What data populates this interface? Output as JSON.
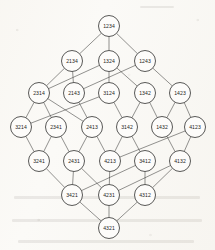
{
  "diagram": {
    "type": "hasse-diagram",
    "node_colors": {
      "fill": "#fdfcfa",
      "stroke": "#2f2f2d",
      "label": "#1f1f1e"
    },
    "edge_color": "#3a3a38",
    "background": "#fbfaf7",
    "node_radius": 10.5,
    "ranks": [
      {
        "rank": 0,
        "y": 26,
        "nodes": [
          {
            "id": "1234",
            "label": "1234",
            "x": 109
          }
        ]
      },
      {
        "rank": 1,
        "y": 61,
        "nodes": [
          {
            "id": "2134",
            "label": "2134",
            "x": 72
          },
          {
            "id": "1324",
            "label": "1324",
            "x": 109
          },
          {
            "id": "1243",
            "label": "1243",
            "x": 145
          }
        ]
      },
      {
        "rank": 2,
        "y": 93,
        "nodes": [
          {
            "id": "2314",
            "label": "2314",
            "x": 39
          },
          {
            "id": "2143",
            "label": "2143",
            "x": 74
          },
          {
            "id": "3124",
            "label": "3124",
            "x": 109
          },
          {
            "id": "1342",
            "label": "1342",
            "x": 145
          },
          {
            "id": "1423",
            "label": "1423",
            "x": 180
          }
        ]
      },
      {
        "rank": 3,
        "y": 127,
        "nodes": [
          {
            "id": "3214",
            "label": "3214",
            "x": 21
          },
          {
            "id": "2341",
            "label": "2341",
            "x": 56
          },
          {
            "id": "2413",
            "label": "2413",
            "x": 92
          },
          {
            "id": "3142",
            "label": "3142",
            "x": 127
          },
          {
            "id": "1432",
            "label": "1432",
            "x": 162
          },
          {
            "id": "4123",
            "label": "4123",
            "x": 195
          }
        ]
      },
      {
        "rank": 4,
        "y": 161,
        "nodes": [
          {
            "id": "3241",
            "label": "3241",
            "x": 39
          },
          {
            "id": "2431",
            "label": "2431",
            "x": 74
          },
          {
            "id": "4213",
            "label": "4213",
            "x": 110
          },
          {
            "id": "3412",
            "label": "3412",
            "x": 145
          },
          {
            "id": "4132",
            "label": "4132",
            "x": 180
          }
        ]
      },
      {
        "rank": 5,
        "y": 195,
        "nodes": [
          {
            "id": "3421",
            "label": "3421",
            "x": 72
          },
          {
            "id": "4231",
            "label": "4231",
            "x": 109
          },
          {
            "id": "4312",
            "label": "4312",
            "x": 145
          }
        ]
      },
      {
        "rank": 6,
        "y": 228,
        "nodes": [
          {
            "id": "4321",
            "label": "4321",
            "x": 109
          }
        ]
      }
    ],
    "edges": [
      [
        "1234",
        "2134"
      ],
      [
        "1234",
        "1324"
      ],
      [
        "1234",
        "1243"
      ],
      [
        "2134",
        "2314"
      ],
      [
        "2134",
        "2143"
      ],
      [
        "1324",
        "2314"
      ],
      [
        "1324",
        "3124"
      ],
      [
        "1324",
        "1342"
      ],
      [
        "1243",
        "2143"
      ],
      [
        "1243",
        "1423"
      ],
      [
        "2314",
        "3214"
      ],
      [
        "2314",
        "2341"
      ],
      [
        "2314",
        "2413"
      ],
      [
        "2143",
        "2413"
      ],
      [
        "3124",
        "3214"
      ],
      [
        "3124",
        "3142"
      ],
      [
        "1342",
        "3142"
      ],
      [
        "1342",
        "1432"
      ],
      [
        "1423",
        "1432"
      ],
      [
        "1423",
        "4123"
      ],
      [
        "3214",
        "3241"
      ],
      [
        "2341",
        "3241"
      ],
      [
        "2341",
        "2431"
      ],
      [
        "2413",
        "2431"
      ],
      [
        "2413",
        "4213"
      ],
      [
        "3142",
        "3412"
      ],
      [
        "3142",
        "4213"
      ],
      [
        "1432",
        "4132"
      ],
      [
        "4123",
        "4213"
      ],
      [
        "4123",
        "4132"
      ],
      [
        "3241",
        "3421"
      ],
      [
        "2431",
        "3421"
      ],
      [
        "2431",
        "4231"
      ],
      [
        "4213",
        "4231"
      ],
      [
        "3412",
        "3421"
      ],
      [
        "3412",
        "4312"
      ],
      [
        "4132",
        "4231"
      ],
      [
        "4132",
        "4312"
      ],
      [
        "3421",
        "4321"
      ],
      [
        "4231",
        "4321"
      ],
      [
        "4312",
        "4321"
      ]
    ]
  }
}
